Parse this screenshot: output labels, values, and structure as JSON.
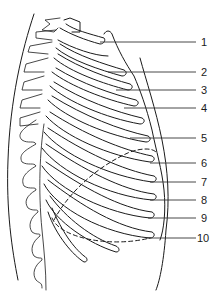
{
  "diagram": {
    "labels": [
      {
        "id": "1",
        "text": "1",
        "y": 42
      },
      {
        "id": "2",
        "text": "2",
        "y": 72
      },
      {
        "id": "3",
        "text": "3",
        "y": 90
      },
      {
        "id": "4",
        "text": "4",
        "y": 108
      },
      {
        "id": "5",
        "text": "5",
        "y": 138
      },
      {
        "id": "6",
        "text": "6",
        "y": 163
      },
      {
        "id": "7",
        "text": "7",
        "y": 182
      },
      {
        "id": "8",
        "text": "8",
        "y": 200
      },
      {
        "id": "9",
        "text": "9",
        "y": 218
      },
      {
        "id": "10",
        "text": "10",
        "y": 238
      }
    ],
    "colors": {
      "stroke": "#1a1a1a",
      "background": "#ffffff"
    }
  }
}
